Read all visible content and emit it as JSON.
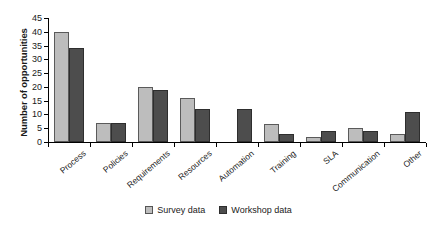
{
  "chart_data": {
    "type": "bar",
    "title": "",
    "xlabel": "",
    "ylabel": "Number of opportunities",
    "ylim": [
      0,
      45
    ],
    "ytick_step": 5,
    "yticks": [
      0,
      5,
      10,
      15,
      20,
      25,
      30,
      35,
      40,
      45
    ],
    "grid": false,
    "legend_position": "bottom-center",
    "categories": [
      "Process",
      "Policies",
      "Requirements",
      "Resources",
      "Automation",
      "Training",
      "SLA",
      "Communication",
      "Other"
    ],
    "series": [
      {
        "name": "Survey data",
        "color": "#bdbdbd",
        "values": [
          40,
          7,
          20,
          16,
          0,
          6.5,
          2,
          5,
          3
        ]
      },
      {
        "name": "Workshop data",
        "color": "#4d4d4d",
        "values": [
          34,
          7,
          19,
          12,
          12,
          3,
          4,
          4,
          11
        ]
      }
    ]
  },
  "axis": {
    "y_title": "Number of opportunities"
  },
  "legend": {
    "items": [
      {
        "label": "Survey data",
        "swatch": "survey"
      },
      {
        "label": "Workshop data",
        "swatch": "workshop"
      }
    ]
  }
}
